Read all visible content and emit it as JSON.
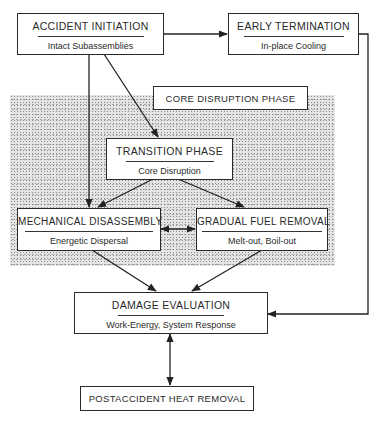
{
  "diagram": {
    "region_label": "CORE DISRUPTION PHASE",
    "nodes": {
      "accident_initiation": {
        "title": "ACCIDENT INITIATION",
        "subtitle": "Intact Subassemblies"
      },
      "early_termination": {
        "title": "EARLY TERMINATION",
        "subtitle": "In-place Cooling"
      },
      "transition_phase": {
        "title": "TRANSITION PHASE",
        "subtitle": "Core Disruption"
      },
      "mechanical_disassembly": {
        "title": "MECHANICAL DISASSEMBLY",
        "subtitle": "Energetic Dispersal"
      },
      "gradual_fuel_removal": {
        "title": "GRADUAL FUEL REMOVAL",
        "subtitle": "Melt-out, Boil-out"
      },
      "damage_evaluation": {
        "title": "DAMAGE EVALUATION",
        "subtitle": "Work-Energy, System Response"
      },
      "postaccident_heat_removal": {
        "title": "POSTACCIDENT HEAT REMOVAL"
      }
    },
    "edges": [
      {
        "from": "accident_initiation",
        "to": "early_termination",
        "type": "directed"
      },
      {
        "from": "accident_initiation",
        "to": "transition_phase",
        "type": "directed"
      },
      {
        "from": "accident_initiation",
        "to": "mechanical_disassembly",
        "type": "directed"
      },
      {
        "from": "transition_phase",
        "to": "mechanical_disassembly",
        "type": "directed"
      },
      {
        "from": "transition_phase",
        "to": "gradual_fuel_removal",
        "type": "directed"
      },
      {
        "from": "mechanical_disassembly",
        "to": "gradual_fuel_removal",
        "type": "bidirectional"
      },
      {
        "from": "mechanical_disassembly",
        "to": "damage_evaluation",
        "type": "directed"
      },
      {
        "from": "gradual_fuel_removal",
        "to": "damage_evaluation",
        "type": "directed"
      },
      {
        "from": "early_termination",
        "to": "damage_evaluation",
        "type": "directed"
      },
      {
        "from": "damage_evaluation",
        "to": "postaccident_heat_removal",
        "type": "bidirectional"
      }
    ]
  }
}
